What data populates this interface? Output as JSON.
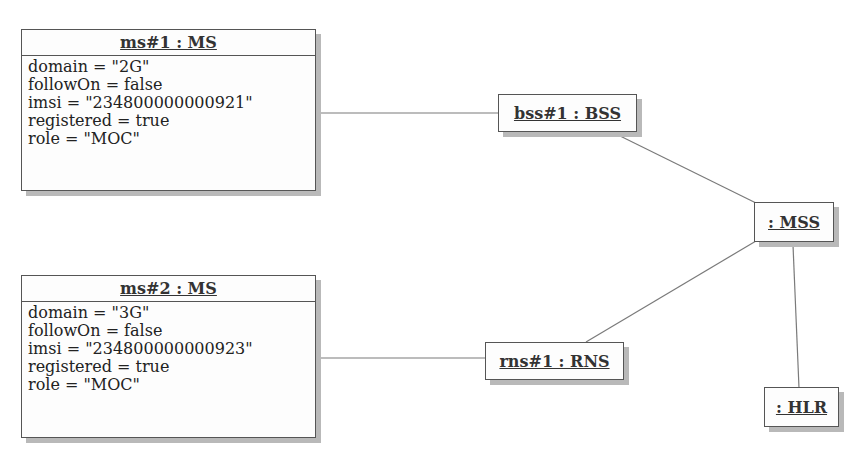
{
  "diagram": {
    "type": "UML object diagram",
    "objects": [
      {
        "id": "ms1",
        "title": "ms#1 : MS",
        "attributes": [
          "domain = \"2G\"",
          "followOn = false",
          "imsi = \"234800000000921\"",
          "registered = true",
          "role = \"MOC\""
        ]
      },
      {
        "id": "ms2",
        "title": "ms#2 : MS",
        "attributes": [
          "domain = \"3G\"",
          "followOn = false",
          "imsi = \"234800000000923\"",
          "registered = true",
          "role = \"MOC\""
        ]
      },
      {
        "id": "bss1",
        "title": "bss#1 : BSS"
      },
      {
        "id": "rns1",
        "title": "rns#1 : RNS"
      },
      {
        "id": "mss",
        "title": ": MSS"
      },
      {
        "id": "hlr",
        "title": ": HLR"
      }
    ],
    "links": [
      {
        "from": "ms#1 : MS",
        "to": "bss#1 : BSS"
      },
      {
        "from": "ms#2 : MS",
        "to": "rns#1 : RNS"
      },
      {
        "from": "bss#1 : BSS",
        "to": ": MSS"
      },
      {
        "from": "rns#1 : RNS",
        "to": ": MSS"
      },
      {
        "from": ": MSS",
        "to": ": HLR"
      }
    ],
    "colors": {
      "border": "#555555",
      "shadow": "#b9b9b9",
      "line": "#777777"
    }
  }
}
